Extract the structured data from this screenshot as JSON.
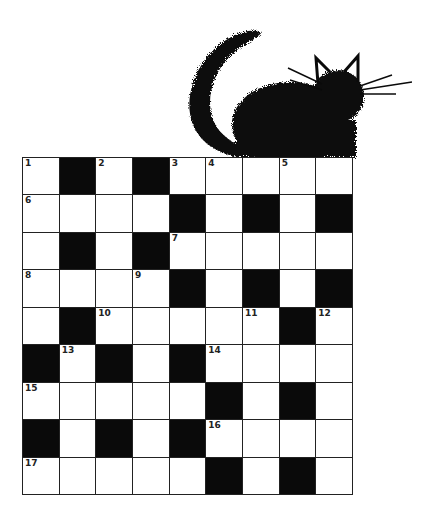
{
  "puzzle": {
    "type": "crossword",
    "rows": 9,
    "cols": 9,
    "colors": {
      "block": "#0a0a0a",
      "cell": "#ffffff",
      "line": "#222222"
    },
    "layout": [
      "W.W.WWWWW",
      "WWWW.W.W.",
      "W.W.WWWWW",
      "WWWW.W.W.",
      "W.WWWWW.W",
      ".W.W.WWWW",
      "WWWWW.W.W",
      ".W.W.WWWW",
      "WWWWW.W.W"
    ],
    "numbers": [
      {
        "n": "1",
        "r": 0,
        "c": 0
      },
      {
        "n": "2",
        "r": 0,
        "c": 2
      },
      {
        "n": "3",
        "r": 0,
        "c": 4
      },
      {
        "n": "4",
        "r": 0,
        "c": 5
      },
      {
        "n": "5",
        "r": 0,
        "c": 7
      },
      {
        "n": "6",
        "r": 1,
        "c": 0
      },
      {
        "n": "7",
        "r": 2,
        "c": 4
      },
      {
        "n": "8",
        "r": 3,
        "c": 0
      },
      {
        "n": "9",
        "r": 3,
        "c": 3
      },
      {
        "n": "10",
        "r": 4,
        "c": 2
      },
      {
        "n": "11",
        "r": 4,
        "c": 6
      },
      {
        "n": "12",
        "r": 4,
        "c": 8
      },
      {
        "n": "13",
        "r": 5,
        "c": 1
      },
      {
        "n": "14",
        "r": 5,
        "c": 5
      },
      {
        "n": "15",
        "r": 6,
        "c": 0
      },
      {
        "n": "16",
        "r": 7,
        "c": 5
      },
      {
        "n": "17",
        "r": 8,
        "c": 0
      }
    ]
  },
  "illustration": {
    "icon": "black-cat-icon",
    "description": "fuzzy black cat sitting on top of crossword grid"
  }
}
